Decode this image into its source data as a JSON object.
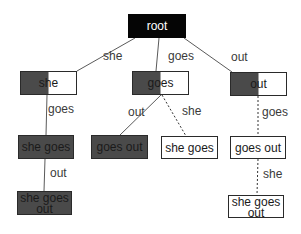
{
  "colors": {
    "root_fill": "#050505",
    "dark_fill": "#4a4a4a",
    "white_fill": "#ffffff",
    "border": "#2a2a2a",
    "edge": "#5a5a5a",
    "text_light": "#ffffff",
    "text_dark": "#1a1a1a"
  },
  "nodes": [
    {
      "id": "root",
      "label": "root",
      "lines": [
        "root"
      ],
      "style": "black",
      "x": 128,
      "y": 14,
      "w": 58,
      "h": 24
    },
    {
      "id": "she",
      "label": "she",
      "lines": [
        "she"
      ],
      "style": "half",
      "x": 20,
      "y": 71,
      "w": 57,
      "h": 24
    },
    {
      "id": "goes",
      "label": "goes",
      "lines": [
        "goes"
      ],
      "style": "half",
      "x": 132,
      "y": 71,
      "w": 57,
      "h": 24
    },
    {
      "id": "out",
      "label": "out",
      "lines": [
        "out"
      ],
      "style": "half",
      "x": 230,
      "y": 72,
      "w": 57,
      "h": 24
    },
    {
      "id": "she_goes",
      "label": "she goes",
      "lines": [
        "she goes"
      ],
      "style": "dark",
      "x": 18,
      "y": 135,
      "w": 56,
      "h": 24
    },
    {
      "id": "goes_out_dark",
      "label": "goes out",
      "lines": [
        "goes out"
      ],
      "style": "dark",
      "x": 91,
      "y": 135,
      "w": 57,
      "h": 24
    },
    {
      "id": "she_goes_white",
      "label": "she goes",
      "lines": [
        "she goes"
      ],
      "style": "white",
      "x": 161,
      "y": 136,
      "w": 57,
      "h": 23
    },
    {
      "id": "goes_out_white",
      "label": "goes out",
      "lines": [
        "goes out"
      ],
      "style": "white",
      "x": 230,
      "y": 136,
      "w": 56,
      "h": 23
    },
    {
      "id": "she_goes_out_dark",
      "label": "she goes out",
      "lines": [
        "she goes",
        "out"
      ],
      "style": "dark",
      "x": 17,
      "y": 191,
      "w": 55,
      "h": 24
    },
    {
      "id": "she_goes_out_white",
      "label": "she goes out",
      "lines": [
        "she goes",
        "out"
      ],
      "style": "white",
      "x": 228,
      "y": 195,
      "w": 56,
      "h": 23
    }
  ],
  "edges": [
    {
      "from": "root",
      "to": "she",
      "label": "she",
      "style": "solid",
      "x1": 135,
      "y1": 38,
      "x2": 77,
      "y2": 71,
      "lx": 103,
      "ly": 60
    },
    {
      "from": "root",
      "to": "goes",
      "label": "goes",
      "style": "solid",
      "x1": 159,
      "y1": 38,
      "x2": 156,
      "y2": 71,
      "lx": 168,
      "ly": 60
    },
    {
      "from": "root",
      "to": "out",
      "label": "out",
      "style": "solid",
      "x1": 184,
      "y1": 38,
      "x2": 232,
      "y2": 72,
      "lx": 231,
      "ly": 61
    },
    {
      "from": "she",
      "to": "she_goes",
      "label": "goes",
      "style": "solid",
      "x1": 47,
      "y1": 95,
      "x2": 46,
      "y2": 135,
      "lx": 48,
      "ly": 113
    },
    {
      "from": "goes",
      "to": "goes_out_dark",
      "label": "out",
      "style": "solid",
      "x1": 161,
      "y1": 95,
      "x2": 120,
      "y2": 135,
      "lx": 128,
      "ly": 116
    },
    {
      "from": "goes",
      "to": "she_goes_white",
      "label": "she",
      "style": "dotted",
      "x1": 162,
      "y1": 95,
      "x2": 186,
      "y2": 136,
      "lx": 182,
      "ly": 115
    },
    {
      "from": "out",
      "to": "goes_out_white",
      "label": "goes",
      "style": "dotted",
      "x1": 258,
      "y1": 96,
      "x2": 258,
      "y2": 136,
      "lx": 262,
      "ly": 116
    },
    {
      "from": "she_goes",
      "to": "she_goes_out_dark",
      "label": "out",
      "style": "solid",
      "x1": 45,
      "y1": 159,
      "x2": 44,
      "y2": 191,
      "lx": 50,
      "ly": 177
    },
    {
      "from": "goes_out_white",
      "to": "she_goes_out_white",
      "label": "she",
      "style": "dotted",
      "x1": 258,
      "y1": 159,
      "x2": 257,
      "y2": 195,
      "lx": 263,
      "ly": 178
    }
  ]
}
